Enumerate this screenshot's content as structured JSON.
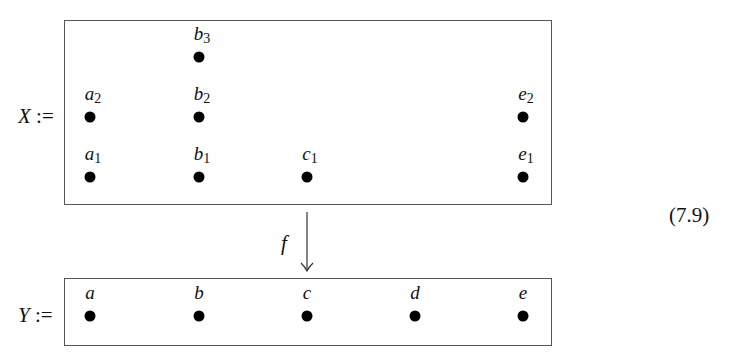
{
  "diagram": {
    "equation_number": "(7.9)",
    "domain_set": {
      "name": "X",
      "assign": ":=",
      "points": [
        {
          "id": "a1",
          "base": "a",
          "sub": "1",
          "x": 90,
          "y": 177
        },
        {
          "id": "a2",
          "base": "a",
          "sub": "2",
          "x": 90,
          "y": 117
        },
        {
          "id": "b1",
          "base": "b",
          "sub": "1",
          "x": 199,
          "y": 177
        },
        {
          "id": "b2",
          "base": "b",
          "sub": "2",
          "x": 199,
          "y": 117
        },
        {
          "id": "b3",
          "base": "b",
          "sub": "3",
          "x": 199,
          "y": 57
        },
        {
          "id": "c1",
          "base": "c",
          "sub": "1",
          "x": 307,
          "y": 177
        },
        {
          "id": "e1",
          "base": "e",
          "sub": "1",
          "x": 523,
          "y": 177
        },
        {
          "id": "e2",
          "base": "e",
          "sub": "2",
          "x": 523,
          "y": 117
        }
      ]
    },
    "map": {
      "label": "f",
      "direction": "down"
    },
    "codomain_set": {
      "name": "Y",
      "assign": ":=",
      "points": [
        {
          "id": "a",
          "base": "a",
          "sub": "",
          "x": 90,
          "y": 316
        },
        {
          "id": "b",
          "base": "b",
          "sub": "",
          "x": 199,
          "y": 316
        },
        {
          "id": "c",
          "base": "c",
          "sub": "",
          "x": 307,
          "y": 316
        },
        {
          "id": "d",
          "base": "d",
          "sub": "",
          "x": 415,
          "y": 316
        },
        {
          "id": "e",
          "base": "e",
          "sub": "",
          "x": 523,
          "y": 316
        }
      ]
    }
  }
}
